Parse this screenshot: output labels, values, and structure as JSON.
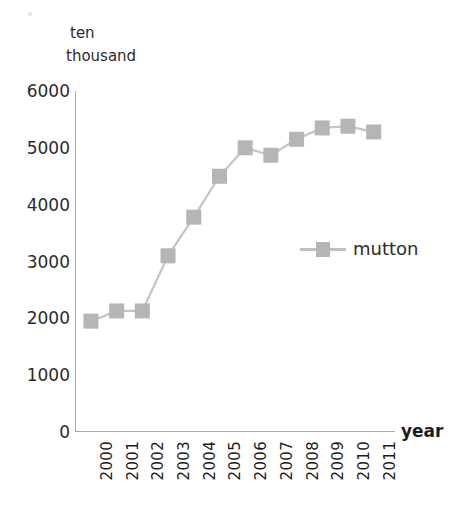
{
  "chart_data": {
    "type": "line",
    "title": "",
    "subtitle": "",
    "xlabel": "year",
    "ylabel": "ten thousand",
    "ylabel_lines": [
      "ten",
      "thousand"
    ],
    "categories": [
      "2000",
      "2001",
      "2002",
      "2003",
      "2004",
      "2005",
      "2006",
      "2007",
      "2008",
      "2009",
      "2010",
      "2011"
    ],
    "series": [
      {
        "name": "mutton",
        "values": [
          1950,
          2130,
          2130,
          3100,
          3780,
          4500,
          5000,
          4870,
          5150,
          5350,
          5380,
          5280
        ],
        "color": "#b5b5b5",
        "marker": "square"
      }
    ],
    "ylim": [
      0,
      6000
    ],
    "yticks": [
      0,
      1000,
      2000,
      3000,
      4000,
      5000,
      6000
    ],
    "ytick_labels": [
      "0",
      "1000",
      "2000",
      "3000",
      "4000",
      "5000",
      "6000"
    ],
    "grid": false,
    "legend_position": "center-right",
    "legend_entries": [
      "mutton"
    ],
    "axis_color": "#a9a9a9"
  },
  "axes": {
    "x_title": "year",
    "y_unit_line1": "ten",
    "y_unit_line2": "thousand"
  },
  "legend": {
    "items": [
      {
        "label": "mutton"
      }
    ]
  }
}
